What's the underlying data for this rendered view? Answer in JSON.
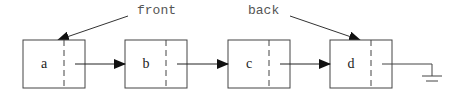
{
  "diagram": {
    "pointers": [
      {
        "label": "front",
        "target": "a"
      },
      {
        "label": "back",
        "target": "d"
      }
    ],
    "nodes": [
      {
        "value": "a"
      },
      {
        "value": "b"
      },
      {
        "value": "c"
      },
      {
        "value": "d"
      }
    ],
    "terminator": "null-ground-symbol"
  }
}
